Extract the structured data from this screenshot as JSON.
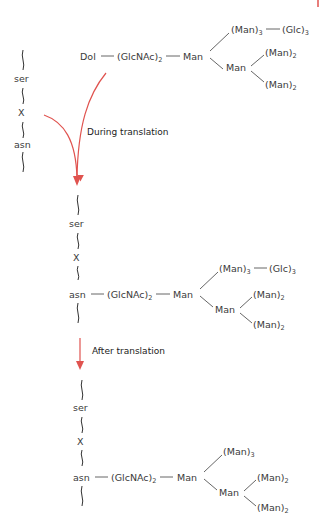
{
  "diagram": {
    "colors": {
      "arrow": "#e0534f",
      "text": "#3a3a3a"
    },
    "stage1": {
      "peptide": [
        "ser",
        "X",
        "asn"
      ],
      "carrier": "Dol",
      "core": "(GlcNAc)",
      "core_sub": "2",
      "branch_man": "Man",
      "arm_top": "(Man)",
      "arm_top_sub": "3",
      "arm_top_ext": "(Glc)",
      "arm_top_ext_sub": "3",
      "arm_mid_man": "Man",
      "arm_a": "(Man)",
      "arm_a_sub": "2",
      "arm_b": "(Man)",
      "arm_b_sub": "2"
    },
    "transition1": {
      "label": "During translation"
    },
    "stage2": {
      "peptide": [
        "ser",
        "X",
        "asn"
      ],
      "core": "(GlcNAc)",
      "core_sub": "2",
      "branch_man": "Man",
      "arm_top": "(Man)",
      "arm_top_sub": "3",
      "arm_top_ext": "(Glc)",
      "arm_top_ext_sub": "3",
      "arm_mid_man": "Man",
      "arm_a": "(Man)",
      "arm_a_sub": "2",
      "arm_b": "(Man)",
      "arm_b_sub": "2"
    },
    "transition2": {
      "label": "After translation"
    },
    "stage3": {
      "peptide": [
        "ser",
        "X",
        "asn"
      ],
      "core": "(GlcNAc)",
      "core_sub": "2",
      "branch_man": "Man",
      "arm_top": "(Man)",
      "arm_top_sub": "3",
      "arm_mid_man": "Man",
      "arm_a": "(Man)",
      "arm_a_sub": "2",
      "arm_b": "(Man)",
      "arm_b_sub": "2"
    }
  }
}
